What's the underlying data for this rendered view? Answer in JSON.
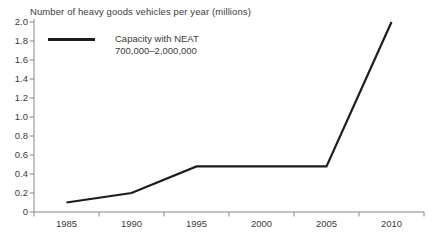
{
  "title": "Number of heavy goods vehicles per year (millions)",
  "legend": {
    "label_line1": "Capacity with NEAT",
    "label_line2": "700,000–2,000,000"
  },
  "colors": {
    "line": "#1d1d1b",
    "axis": "#87878a",
    "text": "#3c3c3b",
    "background": "#ffffff"
  },
  "chart_data": {
    "type": "line",
    "title": "Number of heavy goods vehicles per year (millions)",
    "xlabel": "",
    "ylabel": "",
    "x": [
      1985,
      1990,
      1995,
      2000,
      2005,
      2010
    ],
    "x_tick_labels": [
      "1985",
      "1990",
      "1995",
      "2000",
      "2005",
      "2010"
    ],
    "y_tick_labels": [
      "0",
      "0.2",
      "0.4",
      "0.6",
      "0.8",
      "1.0",
      "1.2",
      "1.4",
      "1.6",
      "1.8",
      "2.0"
    ],
    "ylim": [
      0,
      2.0
    ],
    "xlim_years": [
      1982.5,
      2012.5
    ],
    "series": [
      {
        "name": "Capacity with NEAT 700,000–2,000,000",
        "values": [
          0.1,
          0.2,
          0.48,
          0.48,
          0.48,
          2.0
        ]
      }
    ],
    "grid": false,
    "legend_position": "top-left"
  }
}
